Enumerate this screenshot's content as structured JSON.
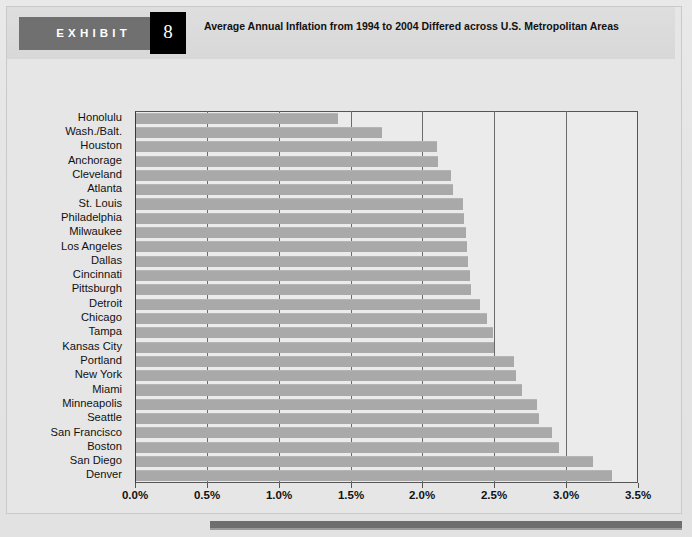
{
  "header": {
    "exhibit_word": "EXHIBIT",
    "exhibit_number": "8",
    "title": "Average Annual Inflation from 1994 to 2004 Differed across U.S. Metropolitan Areas"
  },
  "colors": {
    "bar_fill": "#a9a9a9",
    "plot_background": "#ebebeb",
    "page_background": "#e4e4e4",
    "header_tag": "#707070",
    "number_box": "#000000",
    "gridline": "#6b6b6b",
    "footer_rule": "#6e6e6e"
  },
  "chart_data": {
    "type": "bar",
    "orientation": "horizontal",
    "title": "Average Annual Inflation from 1994 to 2004 Differed across U.S. Metropolitan Areas",
    "xlabel": "",
    "ylabel": "",
    "xlim": [
      0.0,
      3.5
    ],
    "xticks": [
      0.0,
      0.5,
      1.0,
      1.5,
      2.0,
      2.5,
      3.0,
      3.5
    ],
    "xtick_labels": [
      "0.0%",
      "0.5%",
      "1.0%",
      "1.5%",
      "2.0%",
      "2.5%",
      "3.0%",
      "3.5%"
    ],
    "grid": true,
    "legend": null,
    "categories": [
      "Honolulu",
      "Wash./Balt.",
      "Houston",
      "Anchorage",
      "Cleveland",
      "Atlanta",
      "St. Louis",
      "Philadelphia",
      "Milwaukee",
      "Los Angeles",
      "Dallas",
      "Cincinnati",
      "Pittsburgh",
      "Detroit",
      "Chicago",
      "Tampa",
      "Kansas City",
      "Portland",
      "New York",
      "Miami",
      "Minneapolis",
      "Seattle",
      "San Francisco",
      "Boston",
      "San Diego",
      "Denver"
    ],
    "values": [
      1.41,
      1.72,
      2.1,
      2.11,
      2.2,
      2.21,
      2.28,
      2.29,
      2.3,
      2.31,
      2.32,
      2.33,
      2.34,
      2.4,
      2.45,
      2.49,
      2.5,
      2.64,
      2.65,
      2.69,
      2.8,
      2.81,
      2.9,
      2.95,
      3.19,
      3.32
    ]
  }
}
